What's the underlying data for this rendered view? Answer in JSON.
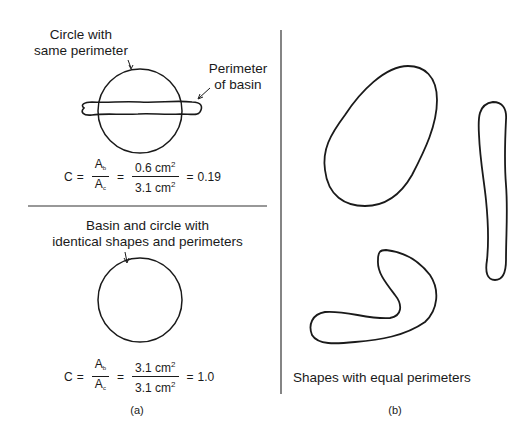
{
  "panel_a": {
    "top": {
      "circle_label_line1": "Circle with",
      "circle_label_line2": "same perimeter",
      "basin_label_line1": "Perimeter",
      "basin_label_line2": "of basin",
      "formula": {
        "lhs": "C",
        "eq1": "=",
        "ratio_num": "A",
        "ratio_num_sub": "b",
        "ratio_den": "A",
        "ratio_den_sub": "c",
        "eq2": "=",
        "value_num": "0.6 cm",
        "value_num_sup": "2",
        "value_den": "3.1 cm",
        "value_den_sup": "2",
        "eq3": "=",
        "result": "0.19"
      }
    },
    "bottom": {
      "label_line1": "Basin and circle with",
      "label_line2": "identical shapes and perimeters",
      "formula": {
        "lhs": "C",
        "eq1": "=",
        "ratio_num": "A",
        "ratio_num_sub": "b",
        "ratio_den": "A",
        "ratio_den_sub": "c",
        "eq2": "=",
        "value_num": "3.1 cm",
        "value_num_sup": "2",
        "value_den": "3.1 cm",
        "value_den_sup": "2",
        "eq3": "=",
        "result": "1.0"
      }
    },
    "caption": "(a)"
  },
  "panel_b": {
    "label": "Shapes with equal perimeters",
    "caption": "(b)"
  },
  "colors": {
    "ink": "#1a1a1a",
    "background": "#ffffff"
  }
}
